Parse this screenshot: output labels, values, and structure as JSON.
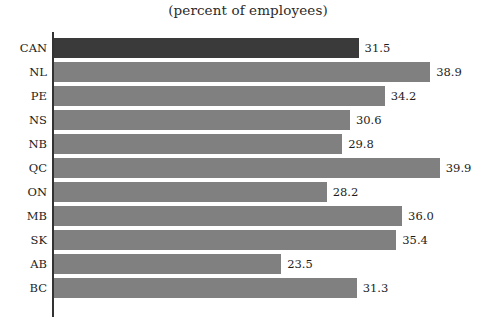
{
  "chart_data": {
    "type": "bar",
    "orientation": "horizontal",
    "title": "(percent of employees)",
    "xlabel": "",
    "ylabel": "",
    "categories": [
      "CAN",
      "NL",
      "PE",
      "NS",
      "NB",
      "QC",
      "ON",
      "MB",
      "SK",
      "AB",
      "BC"
    ],
    "values": [
      31.5,
      38.9,
      34.2,
      30.6,
      29.8,
      39.9,
      28.2,
      36.0,
      35.4,
      23.5,
      31.3
    ],
    "value_labels": [
      "31.5",
      "38.9",
      "34.2",
      "30.6",
      "29.8",
      "39.9",
      "28.2",
      "36.0",
      "35.4",
      "23.5",
      "31.3"
    ],
    "xlim": [
      0,
      39.9
    ],
    "grid": false,
    "legend": "none",
    "highlight_category": "CAN",
    "colors": {
      "bar": "#808080",
      "highlight_bar": "#3a3a3a",
      "axis": "#333333",
      "text": "#1c1c1c",
      "background": "#ffffff"
    }
  }
}
